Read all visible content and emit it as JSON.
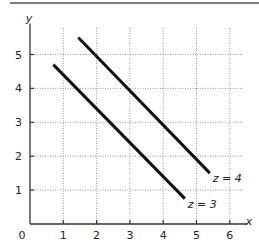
{
  "chart_data": {
    "type": "line",
    "title": "",
    "xlabel": "x",
    "ylabel": "y",
    "xlim": [
      0,
      6.4
    ],
    "ylim": [
      0,
      5.8
    ],
    "x_ticks": [
      "1",
      "2",
      "3",
      "4",
      "5",
      "6"
    ],
    "y_ticks": [
      "1",
      "2",
      "3",
      "4",
      "5"
    ],
    "origin_label": "0",
    "grid": true,
    "grid_style": "dotted",
    "legend": "inline labels at line ends",
    "series": [
      {
        "name": "z = 3",
        "label": "z = 3",
        "x": [
          0.7,
          4.65
        ],
        "y": [
          4.7,
          0.75
        ]
      },
      {
        "name": "z = 4",
        "label": "z = 4",
        "x": [
          1.45,
          5.4
        ],
        "y": [
          5.5,
          1.5
        ]
      }
    ]
  },
  "colors": {
    "line": "#111111",
    "axis": "#333333",
    "grid": "#9a9a9a",
    "top_rule": "#555555"
  }
}
